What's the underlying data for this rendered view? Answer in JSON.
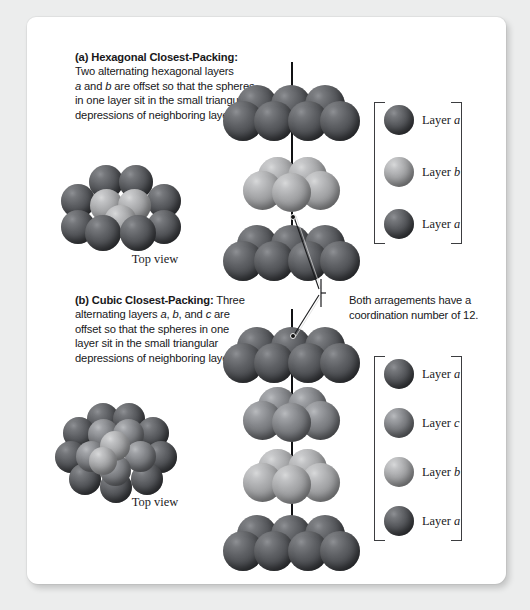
{
  "figure": {
    "panels": [
      {
        "id": "a",
        "tag": "(a)",
        "heading": "Hexagonal Closest-Packing:",
        "body": "Two alternating hexagonal layers a and b are offset so that the spheres in one layer sit in the small triangular depressions of neighboring layers.",
        "body_line1": "Two alternating hexagonal layers",
        "body_line2_pre": "",
        "body_italic_1": "a",
        "body_line2_mid": " and ",
        "body_italic_2": "b",
        "body_line2_post": " are offset so that the spheres",
        "body_line3": "in one layer sit in the small triangular",
        "body_line4": "depressions of neighboring layers.",
        "top_view_label": "Top view",
        "legend": [
          {
            "label_text": "Layer ",
            "layer": "a",
            "shade": "dark"
          },
          {
            "label_text": "Layer ",
            "layer": "b",
            "shade": "light"
          },
          {
            "label_text": "Layer ",
            "layer": "a",
            "shade": "dark"
          }
        ]
      },
      {
        "id": "b",
        "tag": "(b)",
        "heading": "Cubic Closest-Packing:",
        "body": "Three alternating layers a, b, and c are offset so that the spheres in one layer sit in the small triangular depressions of neighboring layers.",
        "body_line1_post": " Three",
        "body_line2_pre": "alternating layers ",
        "body_italic_1": "a",
        "body_line2_mid1": ", ",
        "body_italic_2": "b",
        "body_line2_mid2": ", and ",
        "body_italic_3": "c",
        "body_line2_post": " are",
        "body_line3": "offset so that the spheres in one",
        "body_line4": "layer sit in the small triangular",
        "body_line5": "depressions of neighboring layers.",
        "top_view_label": "Top view",
        "legend": [
          {
            "label_text": "Layer ",
            "layer": "a",
            "shade": "dark"
          },
          {
            "label_text": "Layer ",
            "layer": "c",
            "shade": "medium"
          },
          {
            "label_text": "Layer ",
            "layer": "b",
            "shade": "light"
          },
          {
            "label_text": "Layer ",
            "layer": "a",
            "shade": "dark"
          }
        ]
      }
    ],
    "callout": {
      "line1": "Both arragements have a",
      "line2": "coordination number of 12.",
      "coordination_number": "12"
    },
    "colors": {
      "layer_a_dark": "#4c4e52",
      "layer_c_medium": "#7f8185",
      "layer_b_light": "#abacae",
      "card_background": "#ffffff",
      "page_background": "#eceded",
      "axis_line": "#111214",
      "text": "#18181a"
    }
  }
}
